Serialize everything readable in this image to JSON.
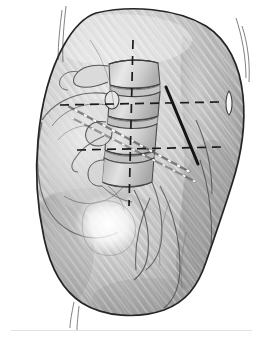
{
  "figure": {
    "title": "Oblique anatomical illustration of the lumbosacral spine and pelvis",
    "style": "grayscale pencil / graphite shaded medical illustration with diagonal hatching",
    "alt_text": "Shaded pencil drawing of the lower back and buttock showing the lumbar vertebrae and iliac bone beneath the skin, overlaid with dashed surgical reference lines and a solid needle trajectory line.",
    "canvas": {
      "width": 263,
      "height": 340,
      "background_color": "#ffffff"
    },
    "palette": {
      "background": "#ffffff",
      "skin_light": "#dedede",
      "skin_mid": "#b4b4b4",
      "skin_dark": "#9a9a9a",
      "skin_shadow": "#8a8a8a",
      "bone_light": "#f2f2f2",
      "bone_mid": "#cfcfcf",
      "outline": "#2b2b2b",
      "contour_line": "#4a4a4a",
      "guide_line": "#1a1a1a",
      "needle_line": "#141414",
      "bead_marker": "#fbfbfb",
      "caption_rule": "#e2e2e2"
    },
    "labels": [],
    "annotations": {
      "vertical_midline": {
        "name": "vertical-dashed-midline",
        "kind": "dashed",
        "color": "#1a1a1a",
        "x1": 133,
        "y1": 40,
        "x2": 129,
        "y2": 206
      },
      "horizontal_upper": {
        "name": "upper-horizontal-dashed-line",
        "kind": "dashed",
        "color": "#1a1a1a",
        "x1": 60,
        "y1": 105,
        "x2": 219,
        "y2": 102
      },
      "horizontal_lower": {
        "name": "lower-horizontal-dashed-line",
        "kind": "dashed",
        "color": "#1a1a1a",
        "x1": 77,
        "y1": 150,
        "x2": 222,
        "y2": 147
      },
      "needle_trajectory": {
        "name": "solid-needle-trajectory-line",
        "kind": "solid",
        "color": "#141414",
        "x1": 166,
        "y1": 87,
        "x2": 198,
        "y2": 164
      },
      "beaded_trajectory": {
        "name": "beaded-dotted-trajectory-line",
        "kind": "beaded",
        "color": "#fbfbfb",
        "x1": 66,
        "y1": 105,
        "x2": 190,
        "y2": 172
      },
      "skin_landmark": {
        "name": "skin-landmark-marking",
        "kind": "lens-shape",
        "cx": 229,
        "cy": 103,
        "rx": 4,
        "ry": 12
      }
    },
    "caption_rule": {
      "visible": true,
      "x": 11,
      "y": 330,
      "width": 241,
      "color": "#e2e2e2"
    }
  }
}
